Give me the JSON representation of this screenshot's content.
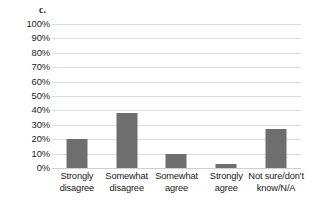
{
  "panel": {
    "label": "c."
  },
  "chart_data": {
    "type": "bar",
    "title": "c.",
    "xlabel": "",
    "ylabel": "",
    "categories": [
      "Strongly disagree",
      "Somewhat disagree",
      "Somewhat agree",
      "Strongly agree",
      "Not sure/don't know/N/A"
    ],
    "category_lines": [
      [
        "Strongly",
        "disagree"
      ],
      [
        "Somewhat",
        "disagree"
      ],
      [
        "Somewhat",
        "agree"
      ],
      [
        "Strongly",
        "agree"
      ],
      [
        "Not sure/don't",
        "know/N/A"
      ]
    ],
    "values": [
      20,
      38,
      10,
      3,
      27
    ],
    "value_labels": [
      "20%",
      "38%",
      "10%",
      "3%",
      "27%"
    ],
    "ylim": [
      0,
      100
    ],
    "ytick_values": [
      100,
      90,
      80,
      70,
      60,
      50,
      40,
      30,
      20,
      10,
      0
    ],
    "ytick_labels": [
      "100%",
      "90%",
      "80%",
      "70%",
      "60%",
      "50%",
      "40%",
      "30%",
      "20%",
      "10%",
      "0%"
    ],
    "grid": true,
    "legend": "none",
    "bar_color": "#6e6e6e",
    "grid_color": "#dcdcdc",
    "background_color": "#ffffff",
    "text_color": "#1a1a1a"
  }
}
